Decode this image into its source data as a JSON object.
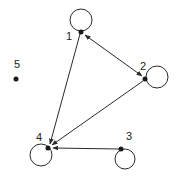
{
  "diagram": {
    "type": "directed-graph",
    "nodes": [
      {
        "id": "1",
        "label": "1",
        "self_loop": true
      },
      {
        "id": "2",
        "label": "2",
        "self_loop": true
      },
      {
        "id": "3",
        "label": "3",
        "self_loop": true
      },
      {
        "id": "4",
        "label": "4",
        "self_loop": true
      },
      {
        "id": "5",
        "label": "5",
        "self_loop": false
      }
    ],
    "edges": [
      {
        "from": "1",
        "to": "2",
        "bidirectional": true
      },
      {
        "from": "1",
        "to": "4",
        "bidirectional": false
      },
      {
        "from": "2",
        "to": "4",
        "bidirectional": false
      },
      {
        "from": "3",
        "to": "4",
        "bidirectional": false
      }
    ],
    "colors": {
      "ink": "#2a2a2a",
      "background": "#ffffff"
    }
  }
}
